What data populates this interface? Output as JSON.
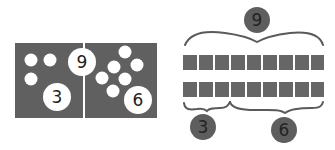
{
  "colors": {
    "panel": "#606060",
    "tile": "#666666",
    "bracket": "#5a5a5a",
    "white": "#ffffff",
    "text": "#222222"
  },
  "left_model": {
    "total_label": "9",
    "left_part": {
      "label": "3",
      "dots": 3
    },
    "right_part": {
      "label": "6",
      "dots": 6
    }
  },
  "right_model": {
    "total_label": "9",
    "rows": [
      {
        "tiles": 9
      },
      {
        "tiles": 9
      }
    ],
    "parts": [
      {
        "label": "3",
        "span_tiles": 3
      },
      {
        "label": "6",
        "span_tiles": 6
      }
    ]
  }
}
